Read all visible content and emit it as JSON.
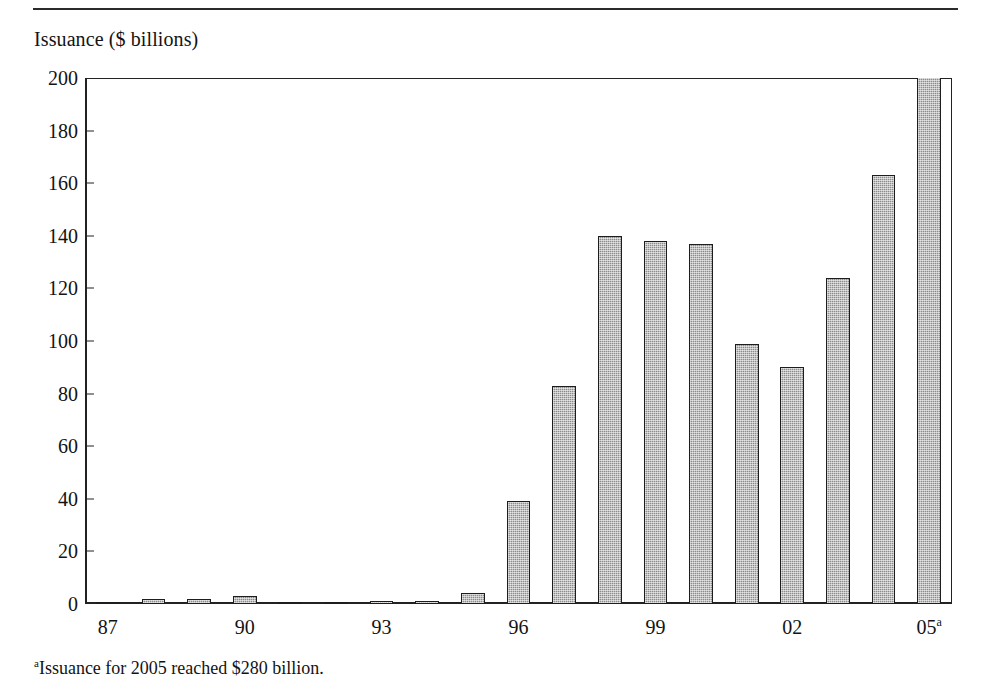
{
  "axis_title": "Issuance ($ billions)",
  "footnote": {
    "marker": "a",
    "text": "Issuance for 2005 reached $280 billion."
  },
  "colors": {
    "bar_fill": "#8c8c8c",
    "bar_outline": "#1d1d1d",
    "axis": "#222222",
    "text": "#131313",
    "background": "#ffffff"
  },
  "chart_data": {
    "type": "bar",
    "title": "",
    "xlabel": "",
    "ylabel": "Issuance ($ billions)",
    "ylim": [
      0,
      200
    ],
    "ytick_labels": [
      "200",
      "180",
      "160",
      "140",
      "120",
      "100",
      "80",
      "60",
      "40",
      "20",
      "0"
    ],
    "yticks": [
      200,
      180,
      160,
      140,
      120,
      100,
      80,
      60,
      40,
      20,
      0
    ],
    "grid": false,
    "legend": "none",
    "categories": [
      "87",
      "88",
      "89",
      "90",
      "91",
      "92",
      "93",
      "94",
      "95",
      "96",
      "97",
      "98",
      "99",
      "00",
      "01",
      "02",
      "03",
      "04",
      "05"
    ],
    "xtick_labels": [
      {
        "index": 0,
        "label": "87",
        "superscript": ""
      },
      {
        "index": 3,
        "label": "90",
        "superscript": ""
      },
      {
        "index": 6,
        "label": "93",
        "superscript": ""
      },
      {
        "index": 9,
        "label": "96",
        "superscript": ""
      },
      {
        "index": 12,
        "label": "99",
        "superscript": ""
      },
      {
        "index": 15,
        "label": "02",
        "superscript": ""
      },
      {
        "index": 18,
        "label": "05",
        "superscript": "a"
      }
    ],
    "values": [
      0.5,
      2,
      2,
      3,
      0.5,
      0.2,
      1,
      1,
      4,
      39,
      83,
      140,
      138,
      137,
      99,
      90,
      124,
      163,
      280
    ],
    "clipped_at": 200,
    "annotations": [
      "Final bar (2005) is clipped by the plot frame; its true value is 280."
    ]
  }
}
